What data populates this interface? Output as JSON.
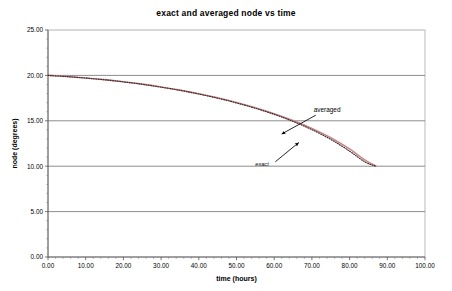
{
  "chart_data": {
    "type": "line",
    "title": "exact and averaged node vs time",
    "xlabel": "time (hours)",
    "ylabel": "node (degrees)",
    "xlim": [
      0,
      100
    ],
    "ylim": [
      0,
      25
    ],
    "xticks": [
      "0.00",
      "10.00",
      "20.00",
      "30.00",
      "40.00",
      "50.00",
      "60.00",
      "70.00",
      "80.00",
      "90.00",
      "100.00"
    ],
    "yticks": [
      "0.00",
      "5.00",
      "10.00",
      "15.00",
      "20.00",
      "25.00"
    ],
    "grid": "horizontal",
    "legend_position": "annotations-inline",
    "series": [
      {
        "name": "averaged",
        "color": "#c98a8a",
        "style": "solid",
        "x": [
          0,
          5,
          10,
          15,
          20,
          25,
          30,
          35,
          40,
          45,
          50,
          55,
          60,
          65,
          70,
          75,
          80,
          84,
          87
        ],
        "values": [
          20.0,
          19.88,
          19.72,
          19.53,
          19.3,
          19.04,
          18.73,
          18.38,
          17.98,
          17.53,
          17.02,
          16.44,
          15.78,
          15.03,
          14.16,
          13.14,
          11.9,
          10.7,
          10.0
        ]
      },
      {
        "name": "exact",
        "color": "#3a2a2a",
        "style": "dotted",
        "x": [
          0,
          5,
          10,
          15,
          20,
          25,
          30,
          35,
          40,
          45,
          50,
          55,
          60,
          65,
          70,
          75,
          80,
          84,
          87
        ],
        "values": [
          20.0,
          19.87,
          19.71,
          19.52,
          19.29,
          19.02,
          18.71,
          18.36,
          17.95,
          17.49,
          16.97,
          16.38,
          15.71,
          14.93,
          14.02,
          12.95,
          11.66,
          10.48,
          10.0
        ]
      }
    ],
    "annotations": [
      {
        "text": "averaged",
        "label_x": 70.5,
        "label_y": 15.95,
        "point_x": 62.0,
        "point_y": 13.55
      },
      {
        "text": "exact",
        "label_x": 55.0,
        "label_y": 10.05,
        "point_x": 66.5,
        "point_y": 12.6
      }
    ]
  }
}
